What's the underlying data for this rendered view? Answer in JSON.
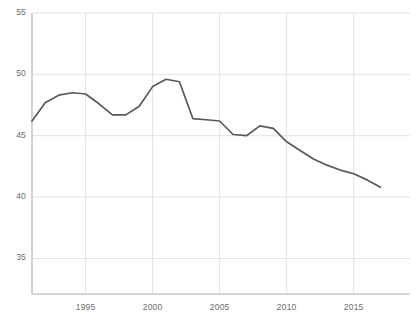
{
  "chart_data": {
    "type": "line",
    "title": "",
    "xlabel": "",
    "ylabel": "",
    "xlim": [
      1991,
      1991.0
    ],
    "ylim": [
      32.5,
      55
    ],
    "grid": true,
    "legend": null,
    "series_color": "#595959",
    "x": [
      1991,
      1992,
      1993,
      1994,
      1995,
      1996,
      1997,
      1998,
      1999,
      2000,
      2001,
      2002,
      2003,
      2004,
      2005,
      2006,
      2007,
      2008,
      2009,
      2010,
      2011,
      2012,
      2013,
      2014,
      2015,
      2016,
      2017
    ],
    "values": [
      46.2,
      47.7,
      48.3,
      48.5,
      48.4,
      47.6,
      46.7,
      46.7,
      47.4,
      49.0,
      49.6,
      49.4,
      46.4,
      46.3,
      46.2,
      45.1,
      45.0,
      45.8,
      45.6,
      44.5,
      43.8,
      43.1,
      42.6,
      42.2,
      41.9,
      41.4,
      40.8
    ],
    "y_ticks": [
      55,
      50,
      45,
      40,
      35
    ],
    "x_ticks": [
      1995,
      2000,
      2005,
      2010,
      2015
    ],
    "axis_color": "#b0b0b0",
    "grid_color": "#e2e2e2",
    "tick_text_color": "#6d6d6d"
  },
  "geometry": {
    "plot_left": 32,
    "plot_right": 410,
    "plot_top": 13,
    "plot_bottom": 294,
    "x_min": 1991,
    "x_max": 2019.2,
    "y_min": 32.1,
    "y_max": 55
  }
}
